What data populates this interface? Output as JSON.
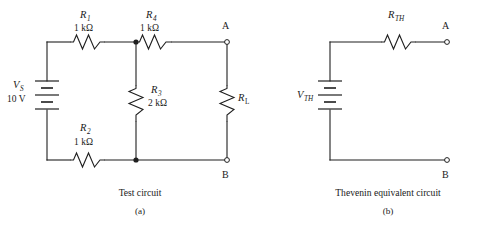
{
  "figure": {
    "background_color": "#ffffff",
    "ink_color": "#1f1f1f",
    "panels": [
      {
        "id": "a",
        "caption": "Test circuit",
        "letter": "(a)",
        "components": {
          "source": {
            "symbol": "V",
            "subscript": "S",
            "value": "10 V",
            "type": "battery"
          },
          "r1": {
            "symbol": "R",
            "subscript": "1",
            "value": "1 kΩ",
            "type": "resistor"
          },
          "r2": {
            "symbol": "R",
            "subscript": "2",
            "value": "1 kΩ",
            "type": "resistor"
          },
          "r3": {
            "symbol": "R",
            "subscript": "3",
            "value": "2 kΩ",
            "type": "resistor"
          },
          "r4": {
            "symbol": "R",
            "subscript": "4",
            "value": "1 kΩ",
            "type": "resistor"
          },
          "rl": {
            "symbol": "R",
            "subscript": "L",
            "value": "",
            "type": "resistor"
          }
        },
        "terminals": [
          {
            "label": "A",
            "style": "open-circle"
          },
          {
            "label": "B",
            "style": "open-circle"
          }
        ],
        "junctions": 2
      },
      {
        "id": "b",
        "caption": "Thevenin equivalent circuit",
        "letter": "(b)",
        "components": {
          "source": {
            "symbol": "V",
            "subscript": "TH",
            "value": "",
            "type": "battery"
          },
          "rth": {
            "symbol": "R",
            "subscript": "TH",
            "value": "",
            "type": "resistor"
          }
        },
        "terminals": [
          {
            "label": "A",
            "style": "open-circle"
          },
          {
            "label": "B",
            "style": "open-circle"
          }
        ],
        "junctions": 0
      }
    ]
  }
}
